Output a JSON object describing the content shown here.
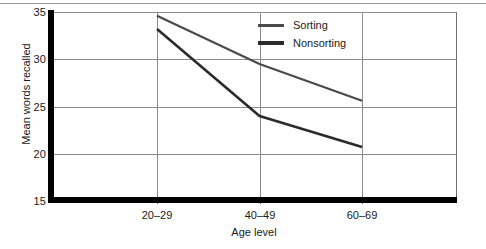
{
  "chart_data": {
    "type": "line",
    "title": "",
    "xlabel": "Age level",
    "ylabel": "Mean words recalled",
    "categories": [
      "20–29",
      "40–49",
      "60–69"
    ],
    "xticks": [
      "20–29",
      "40–49",
      "60–69"
    ],
    "yticks": [
      "15",
      "20",
      "25",
      "30",
      "35"
    ],
    "ylim": [
      15,
      35
    ],
    "grid": "both",
    "legend_position": "top-right-inside",
    "series": [
      {
        "name": "Sorting",
        "values": [
          34.6,
          29.5,
          25.6
        ],
        "color": "#4a4a4a",
        "width": 2.2
      },
      {
        "name": "Nonsorting",
        "values": [
          33.2,
          24.0,
          20.7
        ],
        "color": "#2b2b2b",
        "width": 2.6
      }
    ]
  },
  "axes": {
    "y_title": "Mean words recalled",
    "x_title": "Age level",
    "y_ticks": [
      {
        "label": "35",
        "value": 35
      },
      {
        "label": "30",
        "value": 30
      },
      {
        "label": "25",
        "value": 25
      },
      {
        "label": "20",
        "value": 20
      },
      {
        "label": "15",
        "value": 15
      }
    ],
    "x_ticks": [
      {
        "label": "20–29"
      },
      {
        "label": "40–49"
      },
      {
        "label": "60–69"
      }
    ]
  },
  "legend": {
    "items": [
      {
        "label": "Sorting"
      },
      {
        "label": "Nonsorting"
      }
    ]
  },
  "colors": {
    "sorting": "#4a4a4a",
    "nonsorting": "#2b2b2b",
    "axis": "#000000",
    "grid": "#8c8c8c",
    "frame": "#6e6e6e",
    "background": "#ffffff"
  }
}
